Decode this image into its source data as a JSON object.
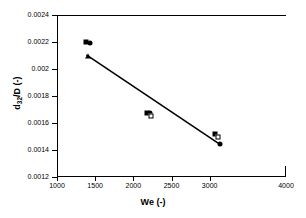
{
  "chart_data": {
    "type": "scatter",
    "title": "",
    "xlabel": "We (-)",
    "ylabel": "d32/D (-)",
    "ylabel_base": "d",
    "ylabel_sub": "32",
    "ylabel_rest": "/D (-)",
    "xlim": [
      1000,
      4000
    ],
    "ylim": [
      0.0012,
      0.0024
    ],
    "grid": false,
    "legend": "none",
    "xticks": [
      1000,
      1500,
      2000,
      2500,
      3000,
      4000
    ],
    "xtick_labels": [
      "1000",
      "1500",
      "2000",
      "2500",
      "3000",
      "4000"
    ],
    "yticks": [
      0.0012,
      0.0014,
      0.0016,
      0.0018,
      0.002,
      0.0022,
      0.0024
    ],
    "ytick_labels": [
      "0.0012",
      "0.0014",
      "0.0016",
      "0.0018",
      "0.002",
      "0.0022",
      "0.0024"
    ],
    "series": [
      {
        "name": "filled-square",
        "marker": "square",
        "points": [
          {
            "x": 1380,
            "y": 0.0022
          },
          {
            "x": 2180,
            "y": 0.001675
          },
          {
            "x": 3070,
            "y": 0.00152
          }
        ]
      },
      {
        "name": "filled-circle",
        "marker": "circle",
        "points": [
          {
            "x": 1430,
            "y": 0.002195
          },
          {
            "x": 2215,
            "y": 0.001672
          },
          {
            "x": 3130,
            "y": 0.001443
          }
        ]
      },
      {
        "name": "open-square",
        "marker": "square-open",
        "points": [
          {
            "x": 2230,
            "y": 0.001655
          },
          {
            "x": 3105,
            "y": 0.001498
          }
        ]
      },
      {
        "name": "filled-triangle",
        "marker": "triangle",
        "points": [
          {
            "x": 1400,
            "y": 0.0021
          }
        ]
      }
    ],
    "trendline": {
      "name": "linear-fit",
      "x_start": 1385,
      "y_start": 0.002105,
      "x_end": 3145,
      "y_end": 0.001438
    }
  }
}
